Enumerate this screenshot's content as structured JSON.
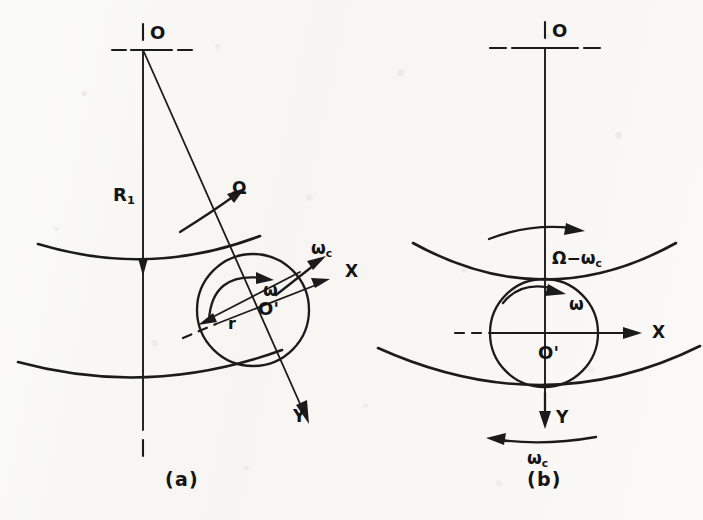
{
  "figure": {
    "kind": "technical-line-diagram",
    "background_color": "#fbfbfa",
    "ink_color": "#1b1b1b",
    "width": 703,
    "height": 520
  },
  "panels": [
    {
      "id": "a",
      "caption": "(a)",
      "frame": "fixed / inertial frame",
      "labels": {
        "center_of_rotation": "O",
        "ball_center": "O'",
        "pitch_radius": "R",
        "pitch_radius_sub": "1",
        "ball_radius": "r",
        "cage_omega": "Ω",
        "ball_spin": "ω",
        "cage_speed": "ω",
        "cage_speed_sub": "c",
        "axis_x": "X",
        "axis_y": "Y"
      }
    },
    {
      "id": "b",
      "caption": "(b)",
      "frame": "cage-rotating frame",
      "labels": {
        "center_of_rotation": "O",
        "ball_center": "O'",
        "race_relative_speed": "Ω−ω",
        "race_relative_speed_sub": "c",
        "ball_spin": "ω",
        "cage_speed": "ω",
        "cage_speed_sub": "c",
        "axis_x": "X",
        "axis_y": "Y"
      }
    }
  ],
  "geometry": {
    "panel_a": {
      "origin_O": [
        143,
        50
      ],
      "ball_center": [
        253,
        310
      ],
      "ball_radius": 56,
      "radial_line_angle_deg": 67,
      "x_axis_angle_deg": -22,
      "outer_race_sagitta_y": 263,
      "inner_race_sagitta_y": 382
    },
    "panel_b": {
      "origin_O": [
        545,
        48
      ],
      "ball_center": [
        544,
        333
      ],
      "ball_radius": 54,
      "outer_race_tangent_y": 279,
      "inner_race_tangent_y": 387
    }
  }
}
